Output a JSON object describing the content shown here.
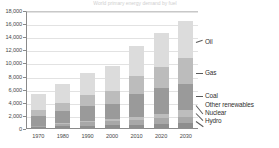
{
  "chart_data": {
    "type": "bar",
    "stacked": true,
    "title": "World primary energy demand by fuel",
    "xlabel": "",
    "ylabel": "",
    "unit": "Mtoe",
    "grid": true,
    "legend_position": "right-callouts",
    "categories": [
      "1970",
      "1980",
      "1990",
      "2000",
      "2010",
      "2020",
      "2030"
    ],
    "ylim": [
      0,
      18000
    ],
    "yticks": [
      "0",
      "2,000",
      "4,000",
      "6,000",
      "8,000",
      "10,000",
      "12,000",
      "14,000",
      "16,000",
      "18,000"
    ],
    "ytick_values": [
      0,
      2000,
      4000,
      6000,
      8000,
      10000,
      12000,
      14000,
      16000,
      18000
    ],
    "series": [
      {
        "name": "Hydro",
        "color": "#8e8e8e",
        "values": [
          330,
          400,
          470,
          560,
          660,
          790,
          920
        ]
      },
      {
        "name": "Nuclear",
        "color": "#a8a8a8",
        "values": [
          90,
          420,
          600,
          680,
          750,
          820,
          880
        ]
      },
      {
        "name": "Other renewables",
        "color": "#bdbdbd",
        "values": [
          70,
          110,
          160,
          240,
          420,
          720,
          1080
        ]
      },
      {
        "name": "Coal",
        "color": "#9a9a9a",
        "values": [
          1480,
          1850,
          2240,
          2320,
          3530,
          3860,
          3920
        ]
      },
      {
        "name": "Gas",
        "color": "#bcbcbc",
        "values": [
          930,
          1230,
          1680,
          2080,
          2690,
          3230,
          4000
        ]
      },
      {
        "name": "Oil",
        "color": "#dcdcdc",
        "values": [
          2400,
          2890,
          3350,
          3720,
          4550,
          5180,
          5700
        ]
      }
    ],
    "totals": [
      5300,
      6900,
      8500,
      9600,
      12600,
      14600,
      16500
    ]
  },
  "callouts": [
    {
      "label": "Oil",
      "name": "callout-oil"
    },
    {
      "label": "Gas",
      "name": "callout-gas"
    },
    {
      "label": "Coal",
      "name": "callout-coal"
    },
    {
      "label": "Other renewables",
      "name": "callout-other-renewables"
    },
    {
      "label": "Nuclear",
      "name": "callout-nuclear"
    },
    {
      "label": "Hydro",
      "name": "callout-hydro"
    }
  ]
}
